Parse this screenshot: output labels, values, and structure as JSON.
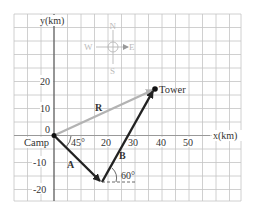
{
  "diagram": {
    "axes": {
      "x_label": "x(km)",
      "y_label": "y(km)",
      "x_ticks": [
        "20",
        "30",
        "40",
        "50"
      ],
      "y_ticks": [
        "20",
        "10",
        "0",
        "-10",
        "-20"
      ]
    },
    "compass": {
      "north": "N",
      "south": "S",
      "east": "E",
      "west": "W"
    },
    "points": {
      "origin": "Camp",
      "destination": "Tower"
    },
    "vectors": [
      {
        "name": "A",
        "angle_label": "45°",
        "color": "#222222"
      },
      {
        "name": "B",
        "angle_label": "60°",
        "color": "#222222"
      },
      {
        "name": "R",
        "color": "#b3b3b3"
      }
    ],
    "colors": {
      "grid": "#b0b0b0",
      "axis": "#333333",
      "resultant": "#b3b3b3",
      "vector": "#222222"
    }
  }
}
